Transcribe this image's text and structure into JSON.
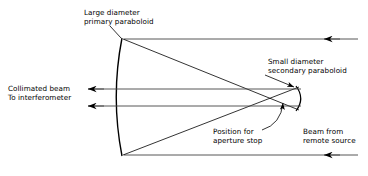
{
  "figure": {
    "type": "optical-ray-diagram",
    "stroke_color": "#000000",
    "background_color": "#ffffff"
  },
  "labels": {
    "primary": {
      "line1": "Large diameter",
      "line2": "primary paraboloid"
    },
    "secondary": {
      "line1": "Small diameter",
      "line2": "secondary paraboloid"
    },
    "collimated": {
      "line1": "Collimated beam",
      "line2": "To interferometer"
    },
    "aperture": {
      "line1": "Position for",
      "line2": "aperture stop"
    },
    "remote": {
      "line1": "Beam from",
      "line2": "remote source"
    }
  },
  "elements": {
    "primary_mirror": {
      "name": "large diameter primary paraboloid",
      "vertex": [
        118,
        97
      ],
      "top_edge": [
        122,
        38
      ],
      "bottom_edge": [
        122,
        156
      ]
    },
    "secondary_mirror": {
      "name": "small diameter secondary paraboloid",
      "vertex": [
        302,
        98
      ],
      "top_edge": [
        296,
        86
      ],
      "bottom_edge": [
        296,
        111
      ]
    },
    "aperture_stop": {
      "name": "position for aperture stop",
      "point": [
        284,
        100
      ]
    }
  },
  "rays": {
    "input_top": {
      "label": "beam from remote source (upper)",
      "from": [
        358,
        39
      ],
      "to": [
        123,
        39
      ],
      "arrow_at": [
        325,
        39
      ],
      "direction": "leftward"
    },
    "input_bottom": {
      "label": "beam from remote source (lower)",
      "from": [
        358,
        155
      ],
      "to": [
        123,
        155
      ],
      "arrow_at": [
        325,
        155
      ],
      "direction": "leftward"
    },
    "output_upper": {
      "label": "collimated beam to interferometer (upper)",
      "from": [
        300,
        89
      ],
      "to": [
        86,
        89
      ],
      "arrow_at": [
        88,
        89
      ],
      "direction": "leftward"
    },
    "output_lower": {
      "label": "collimated beam to interferometer (lower)",
      "from": [
        300,
        106
      ],
      "to": [
        86,
        106
      ],
      "arrow_at": [
        88,
        106
      ],
      "direction": "leftward"
    },
    "reflected_top": {
      "label": "primary to secondary (from top edge)",
      "from": [
        123,
        39
      ],
      "to": [
        299,
        110
      ]
    },
    "reflected_bottom": {
      "label": "primary to secondary (from bottom edge)",
      "from": [
        123,
        155
      ],
      "to": [
        299,
        87
      ]
    }
  }
}
